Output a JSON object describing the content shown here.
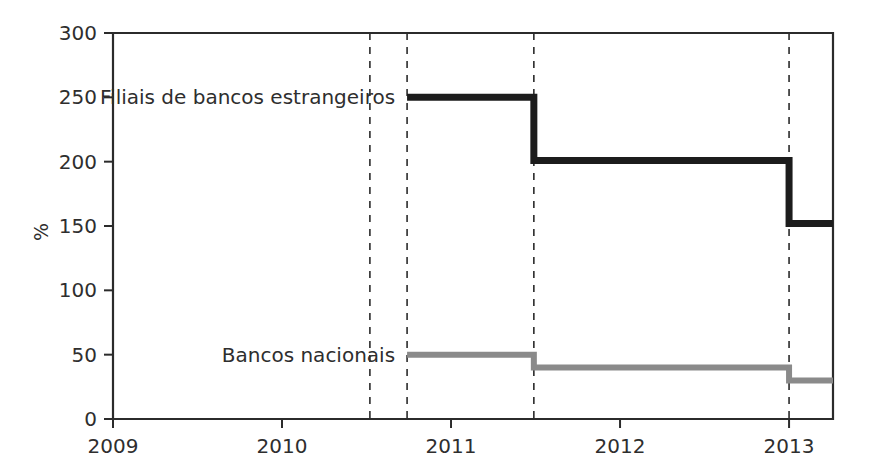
{
  "chart_data": {
    "type": "line",
    "subtype": "step-post",
    "title": "",
    "xlabel": "",
    "ylabel": "%",
    "xlim": [
      2009,
      2013.26
    ],
    "ylim": [
      0,
      300
    ],
    "grid": false,
    "legend_position": "inline-labels",
    "x_ticks": [
      2009,
      2010,
      2011,
      2012,
      2013
    ],
    "x_tick_labels": [
      "2009",
      "2010",
      "2011",
      "2012",
      "2013"
    ],
    "y_ticks": [
      0,
      50,
      100,
      150,
      200,
      250,
      300
    ],
    "y_tick_labels": [
      "0",
      "50",
      "100",
      "150",
      "200",
      "250",
      "300"
    ],
    "annotations": {
      "dashed_verticals": [
        2010.52,
        2010.74,
        2011.49,
        2013.0
      ]
    },
    "series": [
      {
        "name": "Filiais de bancos estrangeiros",
        "color": "#1c1c1c",
        "stroke_width": 7,
        "label_x": 2010.74,
        "label_y": 250,
        "points": [
          {
            "x": 2010.74,
            "y": 250
          },
          {
            "x": 2011.49,
            "y": 250
          },
          {
            "x": 2011.49,
            "y": 201
          },
          {
            "x": 2013.0,
            "y": 201
          },
          {
            "x": 2013.0,
            "y": 152
          },
          {
            "x": 2013.26,
            "y": 152
          }
        ]
      },
      {
        "name": "Bancos nacionais",
        "color": "#8a8a8a",
        "stroke_width": 6,
        "label_x": 2010.74,
        "label_y": 50,
        "points": [
          {
            "x": 2010.74,
            "y": 50
          },
          {
            "x": 2011.49,
            "y": 50
          },
          {
            "x": 2011.49,
            "y": 40
          },
          {
            "x": 2013.0,
            "y": 40
          },
          {
            "x": 2013.0,
            "y": 30
          },
          {
            "x": 2013.26,
            "y": 30
          }
        ]
      }
    ]
  },
  "plot_area": {
    "left": 113,
    "right": 833,
    "top": 33,
    "bottom": 419
  },
  "labels": {
    "y_axis_title": "%",
    "series_one": "Filiais de bancos estrangeiros",
    "series_two": "Bancos nacionais"
  }
}
